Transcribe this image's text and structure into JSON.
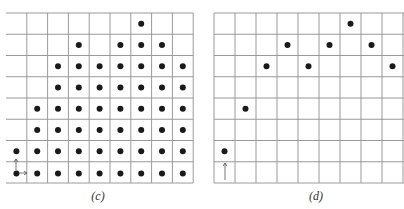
{
  "figure": {
    "grid": {
      "columns": 9,
      "rows": 8,
      "line_color": "#9a9a9a",
      "dot_color": "#1a1a1a"
    },
    "panels": [
      {
        "id": "c",
        "caption": "(c)",
        "origin_x": 6,
        "origin_y": 13,
        "cell_w": 20.8,
        "cell_h": 21.25,
        "left_border": false,
        "right_open": false,
        "dots_by_row": [
          [
            6
          ],
          [
            3,
            5,
            6,
            7
          ],
          [
            2,
            3,
            4,
            5,
            6,
            7,
            8
          ],
          [
            2,
            3,
            4,
            5,
            6,
            7,
            8
          ],
          [
            1,
            2,
            3,
            4,
            5,
            6,
            7,
            8
          ],
          [
            1,
            2,
            3,
            4,
            5,
            6,
            7,
            8
          ],
          [
            0,
            1,
            2,
            3,
            4,
            5,
            6,
            7,
            8
          ],
          [
            0,
            1,
            2,
            3,
            4,
            5,
            6,
            7,
            8
          ]
        ],
        "arrows": [
          {
            "from": [
              16,
              170
            ],
            "to": [
              16,
              159
            ],
            "direction": "up"
          },
          {
            "from": [
              19,
              173
            ],
            "to": [
              27,
              173
            ],
            "direction": "right"
          }
        ]
      },
      {
        "id": "d",
        "caption": "(d)",
        "origin_x": 214,
        "origin_y": 13,
        "cell_w": 21,
        "cell_h": 21.25,
        "left_border": true,
        "right_open": true,
        "dots": [
          {
            "col": 0,
            "row": 6
          },
          {
            "col": 1,
            "row": 4
          },
          {
            "col": 2,
            "row": 2
          },
          {
            "col": 3,
            "row": 1
          },
          {
            "col": 4,
            "row": 2
          },
          {
            "col": 5,
            "row": 1
          },
          {
            "col": 6,
            "row": 0
          },
          {
            "col": 7,
            "row": 1
          },
          {
            "col": 8,
            "row": 2
          }
        ],
        "arrows": [
          {
            "from": [
              225,
              180
            ],
            "to": [
              225,
              163
            ],
            "direction": "up"
          }
        ]
      }
    ]
  }
}
